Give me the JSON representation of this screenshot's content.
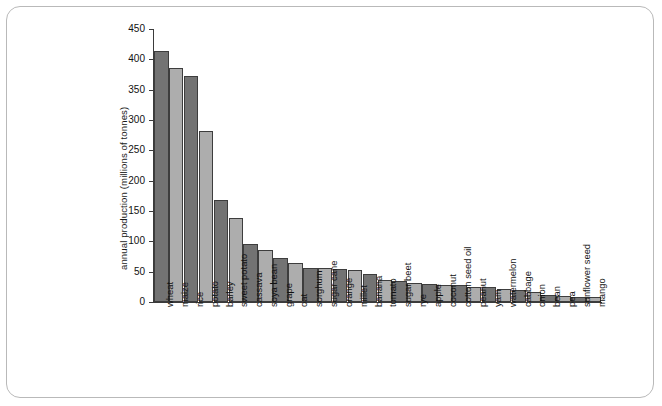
{
  "chart_data": {
    "type": "bar",
    "title": "",
    "subtitle": "",
    "xlabel": "",
    "ylabel": "annual production (millions of tonnes)",
    "ylim": [
      0,
      450
    ],
    "yticks": [
      0,
      50,
      100,
      150,
      200,
      250,
      300,
      350,
      400,
      450
    ],
    "grid": false,
    "legend": null,
    "categories": [
      "wheat",
      "maize",
      "rice",
      "potato",
      "barley",
      "sweet potato",
      "cassava",
      "soya bean",
      "grape",
      "oat",
      "sorghum",
      "sugar cane",
      "orange",
      "millet",
      "banana",
      "tomato",
      "sugar beet",
      "rye",
      "apple",
      "coconut",
      "cotton seed oil",
      "peanut",
      "yam",
      "watermelon",
      "cabbage",
      "onion",
      "bean",
      "pea",
      "sunflower seed",
      "mango"
    ],
    "values": [
      413,
      385,
      372,
      282,
      168,
      138,
      96,
      86,
      72,
      64,
      56,
      56,
      54,
      53,
      46,
      36,
      35,
      32,
      30,
      28,
      28,
      25,
      24,
      22,
      20,
      16,
      11,
      10,
      9,
      9
    ],
    "bar_colors": [
      "#737373",
      "#adadad",
      "#737373",
      "#adadad",
      "#737373",
      "#adadad",
      "#737373",
      "#adadad",
      "#737373",
      "#adadad",
      "#737373",
      "#adadad",
      "#737373",
      "#adadad",
      "#737373",
      "#adadad",
      "#737373",
      "#adadad",
      "#737373",
      "#adadad",
      "#737373",
      "#adadad",
      "#737373",
      "#adadad",
      "#737373",
      "#adadad",
      "#737373",
      "#adadad",
      "#737373",
      "#adadad"
    ]
  },
  "style": {
    "bar_edge_color": "#3d3d3d",
    "axis_color": "#3b3b3b",
    "text_color": "#111111",
    "frame_color": "#b9b9b9",
    "background": "#ffffff",
    "dark_bar": "#737373",
    "light_bar": "#adadad"
  },
  "geometry": {
    "axis_left_px": 153,
    "axis_baseline_y_px": 302,
    "axis_top_y_px": 29,
    "bar_width_px": 14.6,
    "bar_pitch_px": 14.9
  }
}
